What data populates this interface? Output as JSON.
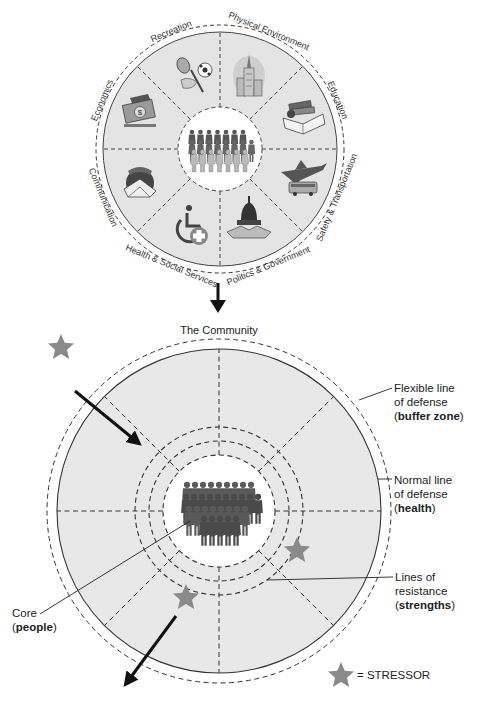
{
  "top_wheel": {
    "center_label": "Community",
    "sectors": [
      {
        "label": "Physical Environment",
        "icon": "city-buildings-icon"
      },
      {
        "label": "Education",
        "icon": "books-icon"
      },
      {
        "label": "Safety & Transportation",
        "icon": "plane-bus-icon"
      },
      {
        "label": "Politics & Government",
        "icon": "capitol-handshake-icon"
      },
      {
        "label": "Health & Social Services",
        "icon": "wheelchair-medical-icon"
      },
      {
        "label": "Communication",
        "icon": "phone-globe-mail-icon"
      },
      {
        "label": "Economics",
        "icon": "money-icon"
      },
      {
        "label": "Recreation",
        "icon": "sports-equipment-icon"
      }
    ]
  },
  "bottom_model": {
    "title": "The Community",
    "labels": {
      "flexible": {
        "line1": "Flexible line",
        "line2": "of defense",
        "paren_open": "(",
        "bold": "buffer zone",
        "paren_close": ")"
      },
      "normal": {
        "line1": "Normal line",
        "line2": "of defense",
        "paren_open": "(",
        "bold": "health",
        "paren_close": ")"
      },
      "resistance": {
        "line1": "Lines of",
        "line2": "resistance",
        "paren_open": "(",
        "bold": "strengths",
        "paren_close": ")"
      },
      "core": {
        "line1": "Core",
        "paren_open": "(",
        "bold": "people",
        "paren_close": ")"
      }
    },
    "legend": {
      "text": "= STRESSOR"
    }
  },
  "colors": {
    "wheel_fill": "#e4e4e4",
    "core_fill": "#ffffff",
    "stressor": "#8a8a8a",
    "people": "#555555",
    "line": "#222222"
  }
}
